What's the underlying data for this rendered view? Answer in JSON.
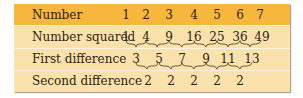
{
  "table": {
    "rows": [
      {
        "label": "Number",
        "values": [
          "1",
          "2",
          "3",
          "4",
          "5",
          "6",
          "7"
        ]
      },
      {
        "label": "Number squared",
        "values": [
          "1",
          "4",
          "9",
          "16",
          "25",
          "36",
          "49"
        ]
      },
      {
        "label": "First difference",
        "values": [
          "3",
          "5",
          "7",
          "9",
          "11",
          "13"
        ]
      },
      {
        "label": "Second difference",
        "values": [
          "2",
          "2",
          "2",
          "2",
          "2"
        ]
      }
    ]
  },
  "colors": {
    "header_bg": "#f6b73c",
    "body_bg": "#fbe2ad",
    "text": "#2a1e10",
    "brace": "#5a4a30"
  }
}
